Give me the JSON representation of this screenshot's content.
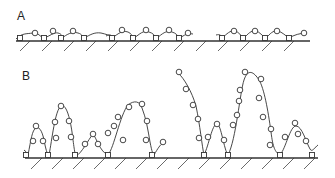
{
  "panels": {
    "A": {
      "label": "A",
      "label_pos": [
        17,
        20
      ],
      "baseline": {
        "y": 41,
        "x1": 16,
        "x2": 310
      },
      "hatch": {
        "start": 30,
        "step": 22,
        "end": 310,
        "len": 10
      },
      "chains": [
        {
          "path": "M16,39 C22,33 26,34 33,33 C38,32 40,37 44,38 C50,36 54,32 58,33 C62,34 62,36 62,38 C66,35 72,31 78,33 C82,34 83,37 84,38 C90,35 94,32 101,33 C106,34 110,36 113,36"
        },
        {
          "path": "M106,36 C110,34 112,35 112,38 C118,34 122,30 128,32 C131,33 132,36 134,38 C140,34 143,30 149,32 C153,33 155,36 157,38 C162,34 166,30 172,32 C176,33 178,36 180,38 C184,35 188,33 193,34"
        },
        {
          "path": "M216,35 C220,34 221,35 222,38 C227,34 230,30 235,31 C239,32 241,36 244,38 C248,34 251,30 256,31 C260,32 262,36 266,38 C270,34 273,30 278,31 C282,32 286,36 289,38 C294,35 300,33 307,33"
        }
      ],
      "circles": [
        [
          35,
          33
        ],
        [
          53,
          31
        ],
        [
          73,
          31
        ],
        [
          122,
          30
        ],
        [
          146,
          30
        ],
        [
          169,
          30
        ],
        [
          188,
          33
        ],
        [
          234,
          31
        ],
        [
          255,
          31
        ],
        [
          277,
          31
        ],
        [
          304,
          33
        ]
      ],
      "squares": [
        [
          20,
          38
        ],
        [
          44,
          38
        ],
        [
          61,
          38
        ],
        [
          84,
          38
        ],
        [
          112,
          38
        ],
        [
          133,
          38
        ],
        [
          156,
          38
        ],
        [
          179,
          38
        ],
        [
          222,
          38
        ],
        [
          243,
          38
        ],
        [
          265,
          38
        ],
        [
          289,
          38
        ]
      ]
    },
    "B": {
      "label": "B",
      "label_pos": [
        22,
        80
      ],
      "baseline": {
        "y": 158,
        "x1": 25,
        "x2": 318
      },
      "hatch": {
        "start": 42,
        "step": 21,
        "end": 318,
        "len": 11
      },
      "chains": [
        {
          "path": "M24,150 C28,153 29,156 28,155 C31,140 32,130 36,128 C40,126 43,133 45,145 C47,154 48,155 49,155 C52,140 55,110 61,106 C66,103 70,118 72,132 C74,148 75,155 76,156 C82,153 88,140 93,134 C96,137 100,152 108,155 C114,148 120,115 128,105 C134,100 140,101 142,108 C146,118 148,130 150,142 C152,152 153,155 154,155 C158,148 160,145 163,143"
        },
        {
          "path": "M178,73 C184,78 192,92 196,106 C200,125 202,146 204,155 C209,145 212,124 217,124 C221,124 224,150 228,155 C236,140 240,92 244,80 C248,68 254,72 259,80 C264,88 268,110 271,132 C273,148 275,152 280,155 C286,148 290,126 296,126 C302,126 306,142 310,149 C312,153 315,147 318,145"
        }
      ],
      "circles": [
        [
          36,
          126
        ],
        [
          33,
          141
        ],
        [
          43,
          141
        ],
        [
          61,
          106
        ],
        [
          55,
          122
        ],
        [
          69,
          121
        ],
        [
          56,
          138
        ],
        [
          71,
          137
        ],
        [
          85,
          144
        ],
        [
          93,
          134
        ],
        [
          98,
          144
        ],
        [
          108,
          133
        ],
        [
          114,
          126
        ],
        [
          129,
          107
        ],
        [
          142,
          104
        ],
        [
          118,
          117
        ],
        [
          123,
          140
        ],
        [
          147,
          121
        ],
        [
          146,
          140
        ],
        [
          163,
          142
        ],
        [
          179,
          72
        ],
        [
          186,
          89
        ],
        [
          193,
          105
        ],
        [
          198,
          119
        ],
        [
          199,
          138
        ],
        [
          208,
          137
        ],
        [
          217,
          124
        ],
        [
          224,
          140
        ],
        [
          233,
          125
        ],
        [
          237,
          115
        ],
        [
          239,
          101
        ],
        [
          245,
          72
        ],
        [
          240,
          90
        ],
        [
          261,
          79
        ],
        [
          259,
          98
        ],
        [
          263,
          117
        ],
        [
          271,
          129
        ],
        [
          270,
          145
        ],
        [
          285,
          137
        ],
        [
          295,
          123
        ],
        [
          298,
          134
        ],
        [
          306,
          141
        ]
      ],
      "squares": [
        [
          26,
          155
        ],
        [
          48,
          155
        ],
        [
          75,
          155
        ],
        [
          108,
          155
        ],
        [
          152,
          155
        ],
        [
          204,
          155
        ],
        [
          228,
          155
        ],
        [
          280,
          155
        ],
        [
          312,
          155
        ]
      ]
    }
  }
}
